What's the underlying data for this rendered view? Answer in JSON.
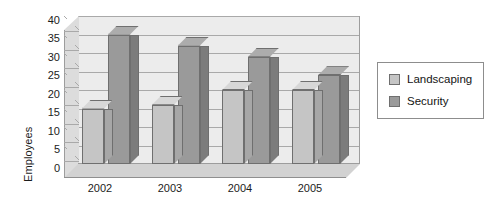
{
  "chart_data": {
    "type": "bar",
    "title": "",
    "subtitle": "",
    "xlabel": "",
    "ylabel": "Employees",
    "categories": [
      "2002",
      "2003",
      "2004",
      "2005"
    ],
    "series": [
      {
        "name": "Landscaping",
        "values": [
          15,
          16,
          20,
          20
        ],
        "color": "#c5c5c5"
      },
      {
        "name": "Security",
        "values": [
          35,
          32,
          29,
          24
        ],
        "color": "#9a9a9a"
      }
    ],
    "ylim": [
      0,
      40
    ],
    "ytick_step": 5,
    "yticks": [
      "40",
      "35",
      "30",
      "25",
      "20",
      "15",
      "10",
      "5",
      "0"
    ],
    "grid": true,
    "grid_axis": "y",
    "legend": true,
    "legend_position": "right",
    "three_d": true,
    "plot_bgcolor": "#ececec",
    "floor_color": "#d2d2d2",
    "grid_color": "#a9a9a9",
    "axis_text_color": "#1c1c1c"
  },
  "legend": {
    "entries": [
      {
        "label": "Landscaping"
      },
      {
        "label": "Security"
      }
    ]
  },
  "axes": {
    "y_title": "Employees"
  }
}
